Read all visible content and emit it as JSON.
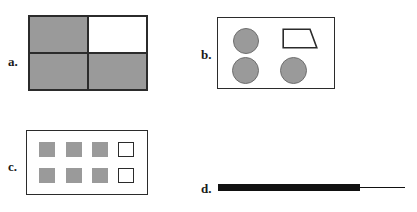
{
  "figure": {
    "background_color": "#ffffff",
    "width": 417,
    "height": 212,
    "panel_count": 4
  },
  "colors": {
    "gray_fill": "#9a9a9a",
    "gray_stroke": "#6e6e6e",
    "outline": "#2b2b2b",
    "black": "#111111",
    "white": "#ffffff"
  },
  "panels": {
    "a": {
      "label": "a.",
      "shape_kind": "square-quadrant-grid",
      "rows": 2,
      "columns": 2,
      "cells": [
        {
          "position": "top-left",
          "fill": "#9a9a9a",
          "state": "filled"
        },
        {
          "position": "top-right",
          "fill": "#ffffff",
          "state": "empty"
        },
        {
          "position": "bottom-left",
          "fill": "#9a9a9a",
          "state": "filled"
        },
        {
          "position": "bottom-right",
          "fill": "#9a9a9a",
          "state": "filled"
        }
      ],
      "filled_count": 3,
      "empty_count": 1
    },
    "b": {
      "label": "b.",
      "shape_kind": "circles-and-trapezoid",
      "items": [
        {
          "shape": "circle",
          "position": "top-left",
          "fill": "#9a9a9a",
          "state": "filled"
        },
        {
          "shape": "trapezoid",
          "position": "top-right",
          "fill": "#ffffff",
          "state": "outline"
        },
        {
          "shape": "circle",
          "position": "bottom-left",
          "fill": "#9a9a9a",
          "state": "filled"
        },
        {
          "shape": "circle",
          "position": "bottom-right",
          "fill": "#9a9a9a",
          "state": "filled"
        }
      ],
      "circle_count": 3,
      "trapezoid_count": 1
    },
    "c": {
      "label": "c.",
      "shape_kind": "small-square-grid",
      "rows": 2,
      "columns": 4,
      "row_pattern": [
        "filled",
        "filled",
        "filled",
        "hollow"
      ],
      "cells": [
        {
          "row": 1,
          "column": 1,
          "state": "filled",
          "fill": "#9a9a9a"
        },
        {
          "row": 1,
          "column": 2,
          "state": "filled",
          "fill": "#9a9a9a"
        },
        {
          "row": 1,
          "column": 3,
          "state": "filled",
          "fill": "#9a9a9a"
        },
        {
          "row": 1,
          "column": 4,
          "state": "hollow",
          "fill": "#ffffff"
        },
        {
          "row": 2,
          "column": 1,
          "state": "filled",
          "fill": "#9a9a9a"
        },
        {
          "row": 2,
          "column": 2,
          "state": "filled",
          "fill": "#9a9a9a"
        },
        {
          "row": 2,
          "column": 3,
          "state": "filled",
          "fill": "#9a9a9a"
        },
        {
          "row": 2,
          "column": 4,
          "state": "hollow",
          "fill": "#ffffff"
        }
      ],
      "filled_count": 6,
      "hollow_count": 2
    },
    "d": {
      "label": "d.",
      "shape_kind": "thick-bar-with-thin-line",
      "bar": {
        "fill": "#111111",
        "thickness": "thick"
      },
      "line": {
        "fill": "#111111",
        "thickness": "thin"
      }
    }
  }
}
